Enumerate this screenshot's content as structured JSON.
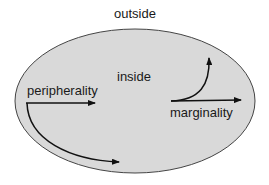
{
  "diagram": {
    "labels": {
      "outside": "outside",
      "inside": "inside",
      "peripherality": "peripherality",
      "marginality": "marginality"
    },
    "colors": {
      "ellipse_fill": "#d9d9d9",
      "ellipse_stroke": "#444444",
      "arrow": "#111111"
    }
  }
}
